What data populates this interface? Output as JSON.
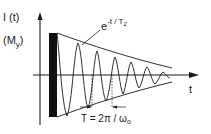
{
  "diagram": {
    "type": "free-induction-decay",
    "y_axis": {
      "label_line1": "I (t)",
      "label_line2_main": "(M",
      "label_line2_sub": "y",
      "label_line2_end": ")"
    },
    "x_axis": {
      "label": "t"
    },
    "envelope": {
      "base": "e",
      "exponent": "-t / T",
      "exponent_sub": "2"
    },
    "period": {
      "prefix": "T = 2π / ω",
      "sub": "o"
    },
    "pulse": {
      "description": "excitation pulse"
    },
    "colors": {
      "ink": "#1a1a1a",
      "background": "#ffffff"
    }
  }
}
